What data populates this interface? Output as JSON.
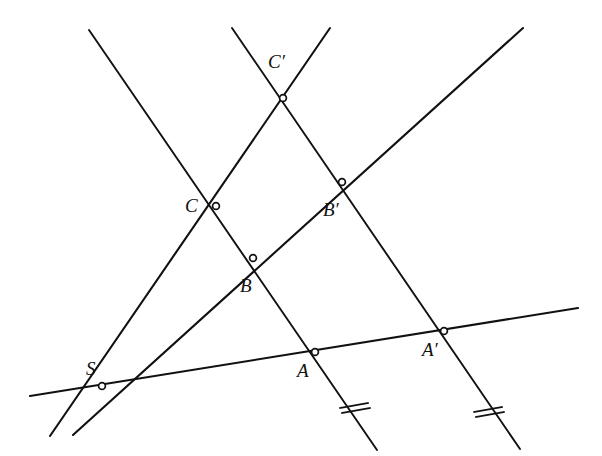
{
  "figure": {
    "width": 602,
    "height": 456,
    "background_color": "#ffffff",
    "stroke_color": "#111111"
  },
  "labels": {
    "S": "S",
    "A": "A",
    "B": "B",
    "C": "C",
    "A_prime": "A′",
    "B_prime": "B′",
    "C_prime": "C′"
  },
  "chart_data": {
    "type": "scatter",
    "xlabel": "",
    "ylabel": "",
    "xlim": [
      0,
      602
    ],
    "ylim": [
      456,
      0
    ],
    "grid": false,
    "legend": "none",
    "points": [
      {
        "name": "S",
        "label": "S",
        "x": 102,
        "y": 386,
        "label_x": 86,
        "label_y": 359
      },
      {
        "name": "A",
        "label": "A",
        "x": 315,
        "y": 352,
        "label_x": 297,
        "label_y": 361
      },
      {
        "name": "B",
        "label": "B",
        "x": 253,
        "y": 258,
        "label_x": 240,
        "label_y": 276
      },
      {
        "name": "C",
        "label": "C",
        "x": 216,
        "y": 206,
        "label_x": 185,
        "label_y": 196
      },
      {
        "name": "A'",
        "label": "A′",
        "x": 444,
        "y": 331,
        "label_x": 422,
        "label_y": 340
      },
      {
        "name": "B'",
        "label": "B′",
        "x": 342,
        "y": 182,
        "label_x": 323,
        "label_y": 200
      },
      {
        "name": "C'",
        "label": "C′",
        "x": 283,
        "y": 98,
        "label_x": 268,
        "label_y": 52
      }
    ],
    "lines": [
      {
        "name": "transversal-through-S-A-Aprime",
        "x1": 30,
        "y1": 396,
        "x2": 578,
        "y2": 308
      },
      {
        "name": "ray-S-C-Cprime",
        "x1": 50,
        "y1": 436,
        "x2": 330,
        "y2": 28
      },
      {
        "name": "ray-S-B-Bprime",
        "x1": 73,
        "y1": 435,
        "x2": 523,
        "y2": 28
      },
      {
        "name": "line-C-B-A-extended",
        "x1": 89,
        "y1": 30,
        "x2": 377,
        "y2": 450
      },
      {
        "name": "line-Cprime-Bprime-Aprime-extended",
        "x1": 232,
        "y1": 28,
        "x2": 520,
        "y2": 449
      }
    ],
    "tick_marks": [
      {
        "name": "congruence-tick-on-segment-A",
        "x": 355,
        "y": 408,
        "count": 2
      },
      {
        "name": "congruence-tick-on-segment-Aprime",
        "x": 489,
        "y": 412,
        "count": 2
      }
    ]
  }
}
